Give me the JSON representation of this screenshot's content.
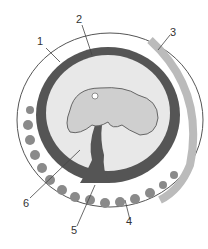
{
  "diagram": {
    "labels": [
      {
        "id": "1",
        "x": 40,
        "y": 40
      },
      {
        "id": "2",
        "x": 77,
        "y": 15
      },
      {
        "id": "3",
        "x": 170,
        "y": 27
      },
      {
        "id": "4",
        "x": 127,
        "y": 224
      },
      {
        "id": "5",
        "x": 72,
        "y": 230
      },
      {
        "id": "6",
        "x": 23,
        "y": 200
      }
    ],
    "colors": {
      "outer_ring": "#ffffff",
      "ring_outline": "#555555",
      "amnion_band": "#555555",
      "cavity": "#e8e8e8",
      "embryo": "#cfcfcf",
      "villi": "#8a8a8a"
    }
  }
}
